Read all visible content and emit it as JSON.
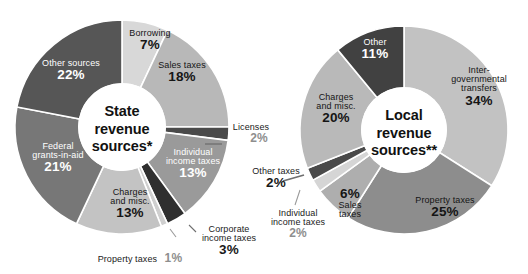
{
  "figure": {
    "background": "#ffffff",
    "charts": [
      {
        "id": "state",
        "center_title_line1": "State",
        "center_title_line2": "revenue",
        "center_title_line3": "sources*"
      },
      {
        "id": "local",
        "center_title_line1": "Local",
        "center_title_line2": "revenue",
        "center_title_line3": "sources**"
      }
    ]
  },
  "chart_data": [
    {
      "type": "pie",
      "title": "State revenue sources*",
      "subtitle": "",
      "xlabel": "",
      "ylabel": "",
      "legend": "none (labels placed on slices)",
      "units": "percent",
      "total": 100,
      "start_angle_deg": 0,
      "direction": "clockwise",
      "categories": [
        "Borrowing",
        "Sales taxes",
        "Licenses",
        "Individual income taxes",
        "Corporate income taxes",
        "Property taxes",
        "Charges and misc.",
        "Federal grants-in-aid",
        "Other sources"
      ],
      "values": [
        7,
        18,
        2,
        13,
        3,
        1,
        13,
        21,
        22
      ],
      "labels": [
        "7%",
        "18%",
        "2%",
        "13%",
        "3%",
        "1%",
        "13%",
        "21%",
        "22%"
      ],
      "colors": [
        "#d8d8d8",
        "#b8b8b8",
        "#4a4a4a",
        "#9a9a9a",
        "#2f2f2f",
        "#cfcfcf",
        "#c3c3c3",
        "#777777",
        "#565656"
      ],
      "label_placement": [
        "inside",
        "inside",
        "outside",
        "inside",
        "outside",
        "outside",
        "inside",
        "inside",
        "inside"
      ]
    },
    {
      "type": "pie",
      "title": "Local revenue sources**",
      "subtitle": "",
      "xlabel": "",
      "ylabel": "",
      "legend": "none (labels placed on slices)",
      "units": "percent",
      "total": 100,
      "start_angle_deg": 0,
      "direction": "clockwise",
      "categories": [
        "Inter-governmental transfers",
        "Property taxes",
        "Sales taxes",
        "Individual income taxes",
        "Other taxes",
        "Charges and misc.",
        "Other"
      ],
      "values": [
        34,
        25,
        6,
        2,
        2,
        20,
        11
      ],
      "labels": [
        "34%",
        "25%",
        "6%",
        "2%",
        "2%",
        "20%",
        "11%"
      ],
      "colors": [
        "#c2c2c2",
        "#8d8d8d",
        "#aeaeae",
        "#d5d5d5",
        "#4a4a4a",
        "#b9b9b9",
        "#414141"
      ],
      "label_placement": [
        "inside",
        "inside",
        "inside",
        "outside",
        "outside",
        "inside",
        "inside"
      ]
    }
  ],
  "state_labels": {
    "borrowing": {
      "name": "Borrowing",
      "pct": "7%"
    },
    "sales_taxes": {
      "name": "Sales taxes",
      "pct": "18%"
    },
    "licenses": {
      "name": "Licenses",
      "pct": "2%"
    },
    "individual_income_taxes": {
      "name_line1": "Individual",
      "name_line2": "income taxes",
      "pct": "13%"
    },
    "corporate_income_taxes": {
      "name_line1": "Corporate",
      "name_line2": "income taxes",
      "pct": "3%"
    },
    "property_taxes": {
      "name": "Property taxes",
      "pct": "1%"
    },
    "charges_and_misc": {
      "name_line1": "Charges",
      "name_line2": "and misc.",
      "pct": "13%"
    },
    "federal_grants": {
      "name_line1": "Federal",
      "name_line2": "grants-in-aid",
      "pct": "21%"
    },
    "other_sources": {
      "name": "Other sources",
      "pct": "22%"
    }
  },
  "local_labels": {
    "intergovernmental": {
      "name_line1": "Inter-",
      "name_line2": "governmental",
      "name_line3": "transfers",
      "pct": "34%"
    },
    "property_taxes": {
      "name": "Property taxes",
      "pct": "25%"
    },
    "sales_taxes": {
      "name_line1": "Sales",
      "name_line2": "taxes",
      "pct": "6%"
    },
    "individual_income_taxes": {
      "name_line1": "Individual",
      "name_line2": "income taxes",
      "pct": "2%"
    },
    "other_taxes": {
      "name": "Other taxes",
      "pct": "2%"
    },
    "charges_and_misc": {
      "name_line1": "Charges",
      "name_line2": "and misc.",
      "pct": "20%"
    },
    "other": {
      "name": "Other",
      "pct": "11%"
    }
  }
}
